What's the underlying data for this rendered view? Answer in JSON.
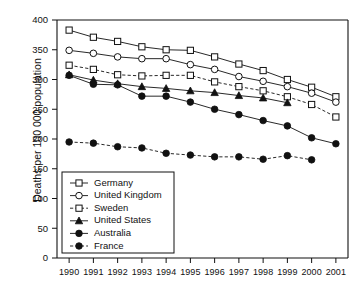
{
  "chart_data": {
    "type": "line",
    "title": "",
    "xlabel": "",
    "ylabel": "Deaths per 100 000 population",
    "x": [
      1990,
      1991,
      1992,
      1993,
      1994,
      1995,
      1996,
      1997,
      1998,
      1999,
      2000,
      2001
    ],
    "categories": [
      "1990",
      "1991",
      "1992",
      "1993",
      "1994",
      "1995",
      "1996",
      "1997",
      "1998",
      "1999",
      "2000",
      "2001"
    ],
    "ylim": [
      0,
      400
    ],
    "yticks": [
      0,
      50,
      100,
      150,
      200,
      250,
      300,
      350,
      400
    ],
    "ytick_labels": [
      "0",
      "50",
      "100",
      "150",
      "200",
      "250",
      "300",
      "350",
      "400"
    ],
    "grid": false,
    "legend_position": "lower-left-inside",
    "series": [
      {
        "name": "Germany",
        "marker": "open-square",
        "line": "solid",
        "values": [
          383,
          371,
          364,
          355,
          350,
          349,
          338,
          326,
          315,
          300,
          287,
          271
        ]
      },
      {
        "name": "United Kingdom",
        "marker": "open-circle",
        "line": "solid",
        "values": [
          349,
          344,
          338,
          335,
          335,
          325,
          317,
          305,
          297,
          288,
          277,
          262
        ]
      },
      {
        "name": "Sweden",
        "marker": "open-square",
        "line": "dashed",
        "values": [
          324,
          317,
          308,
          306,
          307,
          307,
          296,
          288,
          281,
          271,
          258,
          237
        ]
      },
      {
        "name": "United States",
        "marker": "filled-triangle",
        "line": "solid",
        "values": [
          308,
          299,
          293,
          288,
          285,
          281,
          278,
          273,
          269,
          261,
          null,
          null
        ]
      },
      {
        "name": "Australia",
        "marker": "filled-circle",
        "line": "solid",
        "values": [
          307,
          292,
          291,
          272,
          272,
          262,
          250,
          241,
          231,
          222,
          202,
          192
        ]
      },
      {
        "name": "France",
        "marker": "filled-circle",
        "line": "dashed",
        "values": [
          195,
          193,
          187,
          185,
          176,
          173,
          170,
          170,
          166,
          172,
          165,
          null
        ]
      }
    ]
  },
  "legend": {
    "entries": [
      {
        "label": "Germany"
      },
      {
        "label": "United Kingdom"
      },
      {
        "label": "Sweden"
      },
      {
        "label": "United States"
      },
      {
        "label": "Australia"
      },
      {
        "label": "France"
      }
    ]
  },
  "axes": {
    "y_axis_title": "Deaths per 100 000 population"
  }
}
